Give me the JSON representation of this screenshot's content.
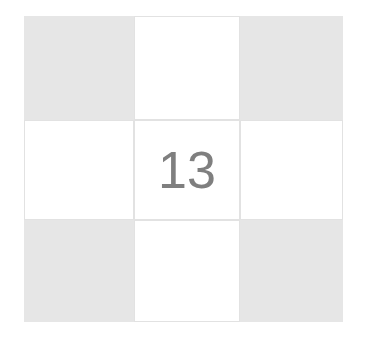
{
  "puzzle": {
    "center_number": "13",
    "cells": [
      {
        "row": 0,
        "col": 0,
        "shaded": true,
        "value": ""
      },
      {
        "row": 0,
        "col": 1,
        "shaded": false,
        "value": ""
      },
      {
        "row": 0,
        "col": 2,
        "shaded": true,
        "value": ""
      },
      {
        "row": 1,
        "col": 0,
        "shaded": false,
        "value": ""
      },
      {
        "row": 1,
        "col": 1,
        "shaded": false,
        "value": "13"
      },
      {
        "row": 1,
        "col": 2,
        "shaded": false,
        "value": ""
      },
      {
        "row": 2,
        "col": 0,
        "shaded": true,
        "value": ""
      },
      {
        "row": 2,
        "col": 1,
        "shaded": false,
        "value": ""
      },
      {
        "row": 2,
        "col": 2,
        "shaded": true,
        "value": ""
      }
    ],
    "colors": {
      "shaded": "#e6e6e6",
      "grid_line": "#e2e2e2",
      "number": "#7f7f7f"
    }
  }
}
